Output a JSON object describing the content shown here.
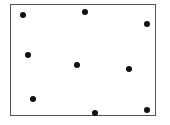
{
  "diagram": {
    "type": "scatter-dots-in-box",
    "frame": {
      "x": 10,
      "y": 4,
      "width": 146,
      "height": 112,
      "border_color": "#555555"
    },
    "dot_color": "#111111",
    "dots": [
      {
        "x": 23,
        "y": 15
      },
      {
        "x": 85,
        "y": 12
      },
      {
        "x": 147,
        "y": 24
      },
      {
        "x": 28,
        "y": 55
      },
      {
        "x": 77,
        "y": 65
      },
      {
        "x": 129,
        "y": 69
      },
      {
        "x": 33,
        "y": 99
      },
      {
        "x": 95,
        "y": 113
      },
      {
        "x": 147,
        "y": 110
      }
    ]
  }
}
